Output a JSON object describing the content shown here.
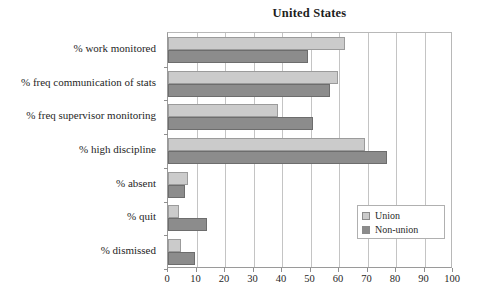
{
  "chart_data": {
    "type": "bar",
    "orientation": "horizontal",
    "title": "United States",
    "xlabel": "",
    "ylabel": "",
    "xlim": [
      0,
      100
    ],
    "xticks": [
      0,
      10,
      20,
      30,
      40,
      50,
      60,
      70,
      80,
      90,
      100
    ],
    "xtick_labels": [
      "0",
      "10",
      "20",
      "30",
      "40",
      "50",
      "60",
      "70",
      "80",
      "90",
      "100"
    ],
    "grid": true,
    "grid_axis": "x",
    "legend_position": "lower-right",
    "categories": [
      "% work monitored",
      "% freq communication of stats",
      "% freq supervisor monitoring",
      "% high discipline",
      "% absent",
      "% quit",
      "% dismissed"
    ],
    "series": [
      {
        "name": "Union",
        "color": "#cbcbcb",
        "values": [
          62,
          59.5,
          38.5,
          69,
          7,
          4,
          4.6
        ]
      },
      {
        "name": "Non-union",
        "color": "#8c8c8c",
        "values": [
          49,
          57,
          51,
          77,
          5.8,
          13.8,
          9.4
        ]
      }
    ]
  },
  "legend": {
    "items": [
      {
        "label": "Union",
        "color": "#cbcbcb"
      },
      {
        "label": "Non-union",
        "color": "#8c8c8c"
      }
    ]
  },
  "colors": {
    "union": "#cbcbcb",
    "nonunion": "#8c8c8c",
    "grid": "#c4c4c4",
    "axis": "#9a9a9a",
    "text": "#262626",
    "background": "#ffffff"
  }
}
